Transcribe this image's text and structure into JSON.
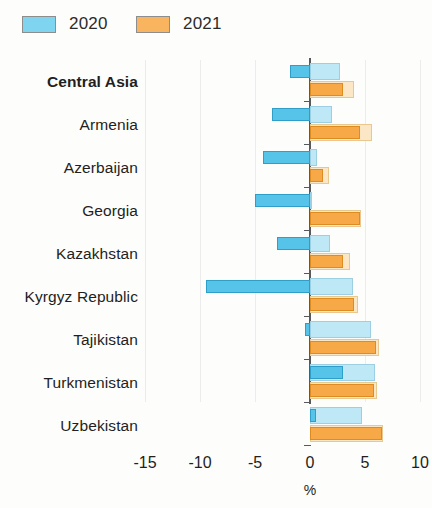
{
  "legend": {
    "items": [
      {
        "label": "2020",
        "color": "#56c3e8"
      },
      {
        "label": "2021",
        "color": "#f6a946"
      }
    ]
  },
  "axis": {
    "unit": "%",
    "ticks": [
      "-15",
      "-10",
      "-5",
      "0",
      "5",
      "10"
    ]
  },
  "chart_data": {
    "type": "bar",
    "orientation": "horizontal",
    "title": "",
    "xlabel": "%",
    "ylabel": "",
    "xlim": [
      -15,
      10
    ],
    "xticks": [
      -15,
      -10,
      -5,
      0,
      5,
      10
    ],
    "grid": true,
    "legend_position": "top-left",
    "categories": [
      "Central Asia",
      "Armenia",
      "Azerbaijan",
      "Georgia",
      "Kazakhstan",
      "Kyrgyz Republic",
      "Tajikistan",
      "Turkmenistan",
      "Uzbekistan"
    ],
    "series": [
      {
        "name": "2020",
        "values": [
          -1.8,
          -3.5,
          -4.3,
          -5.0,
          -3.0,
          -9.5,
          -0.5,
          3.0,
          0.5
        ]
      },
      {
        "name": "2021",
        "values": [
          3.0,
          4.5,
          1.2,
          4.5,
          3.0,
          4.0,
          6.0,
          5.8,
          6.5
        ]
      }
    ],
    "series_outer": [
      {
        "name": "2020 range",
        "values": [
          2.7,
          2.0,
          0.6,
          0.15,
          1.8,
          3.9,
          5.5,
          5.9,
          4.7
        ]
      },
      {
        "name": "2021 range",
        "values": [
          4.0,
          5.6,
          1.7,
          4.6,
          3.6,
          4.4,
          6.3,
          6.1,
          6.6
        ]
      }
    ]
  }
}
